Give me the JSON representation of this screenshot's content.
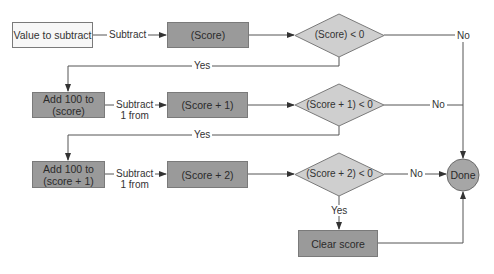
{
  "diagram": {
    "nodes": {
      "value_to_subtract": "Value to subtract",
      "score": "(Score)",
      "decision_score": "(Score) < 0",
      "add100_score": "Add 100 to\n(score)",
      "score_plus_1": "(Score + 1)",
      "decision_score_plus_1": "(Score + 1) < 0",
      "add100_score_plus_1": "Add 100 to\n(score + 1)",
      "score_plus_2": "(Score + 2)",
      "decision_score_plus_2": "(Score + 2) < 0",
      "clear_score": "Clear score",
      "done": "Done"
    },
    "edges": {
      "subtract": "Subtract",
      "subtract_1_from_a": "Subtract\n1 from",
      "subtract_1_from_b": "Subtract\n1 from",
      "yes_1": "Yes",
      "yes_2": "Yes",
      "yes_3": "Yes",
      "no_1": "No",
      "no_2": "No",
      "no_3": "No"
    },
    "colors": {
      "light_fill": "#f7f7f7",
      "dark_fill": "#9a9a9a",
      "diamond_fill": "#cfcfcf",
      "done_fill": "#a6a6a6",
      "line": "#555555"
    }
  }
}
